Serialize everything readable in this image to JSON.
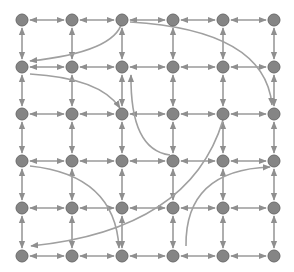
{
  "diagram": {
    "type": "grid-graph",
    "width": 294,
    "height": 272,
    "colors": {
      "background": "#ffffff",
      "node_fill": "#858585",
      "node_stroke": "#6a6a6a",
      "edge": "#9a9a9a",
      "long_range_edge": "#a0a0a0"
    },
    "node_radius": 6,
    "columns_x": [
      22,
      72,
      122,
      173,
      223,
      274
    ],
    "rows_y": [
      20,
      67,
      114,
      161,
      208,
      256
    ],
    "grid_edges": "bidirectional between all horizontally and vertically adjacent nodes",
    "long_range_edges": [
      {
        "from": [
          122,
          22
        ],
        "to": [
          30,
          61
        ],
        "ctrl": [
          115,
          52
        ],
        "label": "top-center to left row2"
      },
      {
        "from": [
          30,
          74
        ],
        "to": [
          120,
          108
        ],
        "ctrl": [
          100,
          78
        ],
        "label": "left row2 to center row3"
      },
      {
        "from": [
          130,
          22
        ],
        "to": [
          272,
          105
        ],
        "ctrl": [
          265,
          30
        ],
        "label": "top-center to right row3"
      },
      {
        "from": [
          170,
          155
        ],
        "to": [
          131,
          75
        ],
        "ctrl": [
          130,
          150
        ],
        "label": "row4 to row2"
      },
      {
        "from": [
          30,
          166
        ],
        "to": [
          119,
          248
        ],
        "ctrl": [
          115,
          175
        ],
        "label": "left row4 to bottom center"
      },
      {
        "from": [
          223,
          120
        ],
        "to": [
          31,
          246
        ],
        "ctrl": [
          190,
          230
        ],
        "label": "row3 to left bottom"
      },
      {
        "from": [
          186,
          246
        ],
        "to": [
          270,
          167
        ],
        "ctrl": [
          185,
          170
        ],
        "label": "bottom to right row4"
      }
    ]
  }
}
